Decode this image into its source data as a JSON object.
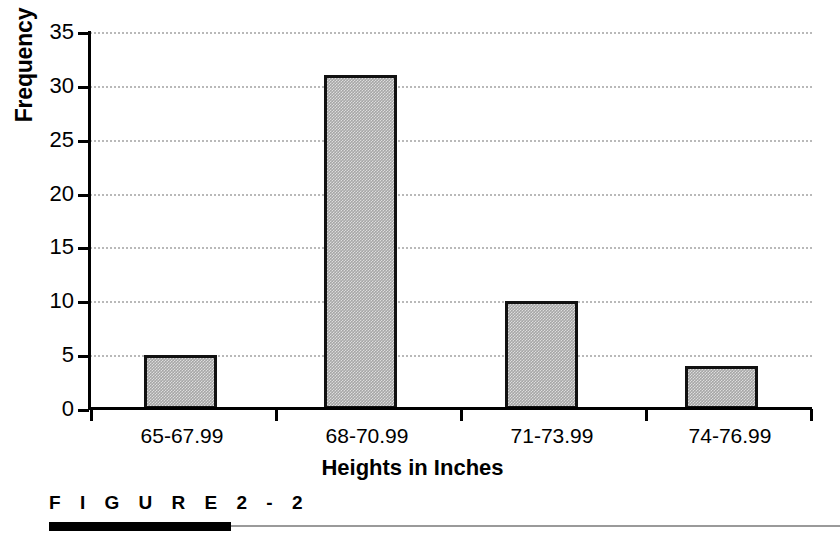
{
  "figure": {
    "caption_label": "F I G U R E   2 - 2"
  },
  "chart_data": {
    "type": "bar",
    "title": "",
    "subtitle": "",
    "categories": [
      "65-67.99",
      "68-70.99",
      "71-73.99",
      "74-76.99"
    ],
    "values": [
      5,
      31,
      10,
      4
    ],
    "xlabel": "Heights in Inches",
    "ylabel": "Frequency",
    "ylim": [
      0,
      35
    ],
    "yticks": [
      0,
      5,
      10,
      15,
      20,
      25,
      30,
      35
    ],
    "ytick_labels": [
      "0",
      "5",
      "10",
      "15",
      "20",
      "25",
      "30",
      "35"
    ],
    "grid": true,
    "grid_axis": "y",
    "grid_style": "dotted",
    "legend": false,
    "legend_position": "none",
    "bar_fill_color": "#a6a6a6",
    "bar_edge_color": "#111111",
    "grid_color": "#b9b9b9",
    "axis_color": "#000000"
  }
}
